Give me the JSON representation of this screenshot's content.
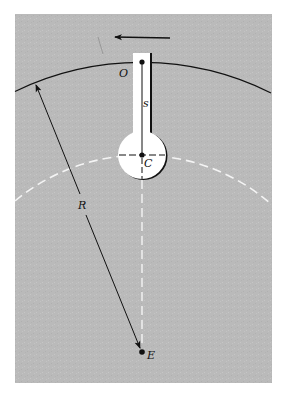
{
  "figure": {
    "colors": {
      "background": "#ffffff",
      "panel": "#b9b9b9",
      "ink": "#111111",
      "slot": "#ffffff",
      "dashed": "#f2f2f2"
    },
    "labels": {
      "O": "O",
      "s": "s",
      "C": "C",
      "R": "R",
      "E": "E"
    },
    "points": {
      "O": {
        "x": 142,
        "y": 62
      },
      "C": {
        "x": 142,
        "y": 155
      },
      "E": {
        "x": 142,
        "y": 352
      }
    },
    "outer_arc_radius": 290,
    "dashed_arc_radius": 197,
    "rotation_arrow": "counterclockwise"
  }
}
